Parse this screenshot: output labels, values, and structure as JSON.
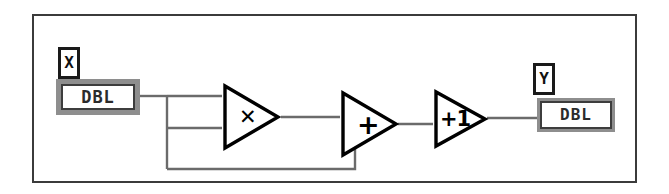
{
  "diagram": {
    "kind": "labview-block-diagram",
    "frame_color": "#3b3b3b",
    "background": "#ffffff",
    "wire_color": "#6b6b6b",
    "expression": "Y = X*X + X + 1"
  },
  "input_terminal": {
    "label": "X",
    "datatype": "DBL",
    "role": "control",
    "border_color": "#8e8e8e"
  },
  "output_terminal": {
    "label": "Y",
    "datatype": "DBL",
    "role": "indicator",
    "border_color": "#8e8e8e"
  },
  "nodes": [
    {
      "id": "multiply",
      "glyph": "✕",
      "name": "multiply-node"
    },
    {
      "id": "add",
      "glyph": "+",
      "name": "add-node"
    },
    {
      "id": "increment",
      "glyph": "+1",
      "name": "increment-node"
    }
  ],
  "wires": [
    {
      "id": "x-to-branch",
      "from": "input_terminal",
      "to": "branch"
    },
    {
      "id": "branch-to-mult-top",
      "from": "branch",
      "to": "multiply"
    },
    {
      "id": "branch-to-mult-bot",
      "from": "branch",
      "to": "multiply"
    },
    {
      "id": "branch-to-add-bot",
      "from": "branch",
      "to": "add"
    },
    {
      "id": "mult-to-add",
      "from": "multiply",
      "to": "add"
    },
    {
      "id": "add-to-increment",
      "from": "add",
      "to": "increment"
    },
    {
      "id": "increment-to-y",
      "from": "increment",
      "to": "output_terminal"
    }
  ]
}
